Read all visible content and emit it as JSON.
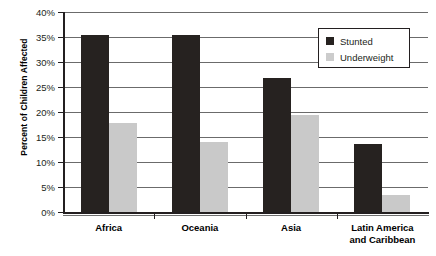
{
  "chart_data": {
    "type": "bar",
    "title": "",
    "xlabel": "",
    "ylabel": "Percent of Children Affected",
    "ylim": [
      0,
      40
    ],
    "grid": true,
    "legend_position": "top-right",
    "categories": [
      "Africa",
      "Oceania",
      "Asia",
      "Latin America and Caribbean"
    ],
    "category_lines": [
      [
        "Africa"
      ],
      [
        "Oceania"
      ],
      [
        "Asia"
      ],
      [
        "Latin America",
        "and Caribbean"
      ]
    ],
    "series": [
      {
        "name": "Stunted",
        "color": "#262220",
        "values": [
          35.5,
          35.4,
          26.8,
          13.6
        ]
      },
      {
        "name": "Underweight",
        "color": "#c9c9c9",
        "values": [
          17.8,
          14.1,
          19.5,
          3.5
        ]
      }
    ],
    "y_ticks": [
      {
        "value": 0,
        "label": "0%"
      },
      {
        "value": 5,
        "label": "5%"
      },
      {
        "value": 10,
        "label": "10%"
      },
      {
        "value": 15,
        "label": "15%"
      },
      {
        "value": 20,
        "label": "20%"
      },
      {
        "value": 25,
        "label": "25%"
      },
      {
        "value": 30,
        "label": "30%"
      },
      {
        "value": 35,
        "label": "35%"
      },
      {
        "value": 40,
        "label": "40%"
      }
    ]
  },
  "legend": {
    "items": [
      {
        "label": "Stunted",
        "color": "#262220"
      },
      {
        "label": "Underweight",
        "color": "#cccccc"
      }
    ]
  },
  "colors": {
    "stunted": "#262220",
    "underweight": "#c9c9c9",
    "axis": "#231f20",
    "gridline": "#6b6b6b",
    "background": "#ffffff"
  }
}
